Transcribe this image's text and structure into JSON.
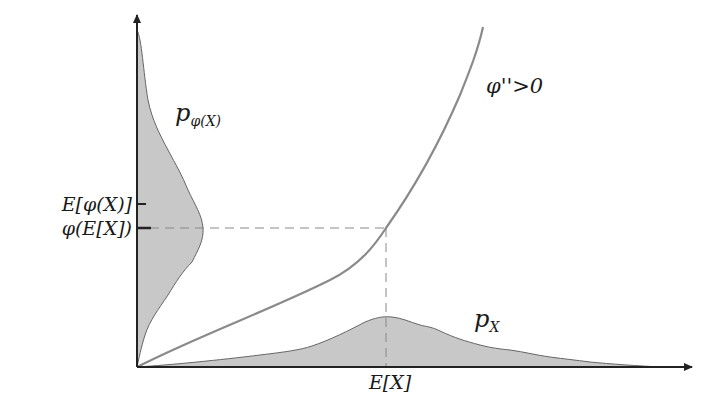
{
  "figure": {
    "colors": {
      "axis": "#222222",
      "curve": "#8a8a8a",
      "density_fill": "#c8c8c8",
      "density_stroke": "#666666",
      "dashed": "#888888",
      "background": "#ffffff"
    }
  },
  "labels": {
    "curve_label": "φ''>0",
    "py_label_main": "p",
    "py_label_sub": "φ(X)",
    "px_label_main": "p",
    "px_label_sub": "X",
    "y_tick_upper": "E[φ(X)]",
    "y_tick_lower": "φ(E[X])",
    "x_tick": "E[X]"
  },
  "geometry": {
    "origin": [
      137,
      367
    ],
    "x_axis_end": [
      692,
      367
    ],
    "y_axis_end": [
      137,
      15
    ],
    "ex_x": 386,
    "phi_ex_y": 228,
    "e_phi_y": 204
  }
}
